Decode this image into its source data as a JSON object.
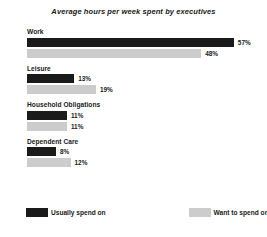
{
  "chart_data": {
    "type": "bar",
    "title": "Average hours per week spent by executives",
    "xlabel": "",
    "ylabel": "",
    "orientation": "horizontal",
    "grid": false,
    "legend_position": "bottom-left",
    "xlim": [
      0,
      62
    ],
    "unit": "%",
    "categories": [
      "Work",
      "Leisure",
      "Household Obligations",
      "Dependent Care"
    ],
    "series": [
      {
        "name": "Usually spend on",
        "color": "#1a1a1a",
        "values": [
          57,
          13,
          11,
          8
        ],
        "labels": [
          "57%",
          "13%",
          "11%",
          "8%"
        ]
      },
      {
        "name": "Want to spend on",
        "color": "#cccccc",
        "values": [
          48,
          19,
          11,
          12
        ],
        "labels": [
          "48%",
          "19%",
          "11%",
          "12%"
        ]
      }
    ]
  },
  "legend": {
    "items": [
      {
        "label": "Usually spend on",
        "color": "#1a1a1a"
      },
      {
        "label": "Want to spend on",
        "color": "#cccccc"
      }
    ]
  }
}
